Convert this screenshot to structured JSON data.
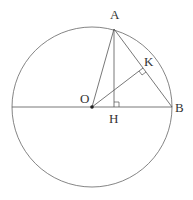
{
  "diagram": {
    "type": "geometry",
    "circle": {
      "cx": 92,
      "cy": 107,
      "r": 80
    },
    "points": {
      "A": {
        "x": 114,
        "y": 29,
        "label": "A",
        "lx": 110,
        "ly": 19
      },
      "B": {
        "x": 172,
        "y": 107,
        "label": "B",
        "lx": 175,
        "ly": 112
      },
      "O": {
        "x": 92,
        "y": 107,
        "label": "O",
        "lx": 80,
        "ly": 103
      },
      "H": {
        "x": 114,
        "y": 107,
        "label": "H",
        "lx": 109,
        "ly": 123
      },
      "K": {
        "x": 143,
        "y": 68,
        "label": "K",
        "lx": 144,
        "ly": 66
      }
    },
    "segments": [
      "OA",
      "AB",
      "AH",
      "OK",
      "diameter through O and B"
    ],
    "right_angles": [
      "H",
      "K"
    ],
    "line_color": "#555555"
  }
}
